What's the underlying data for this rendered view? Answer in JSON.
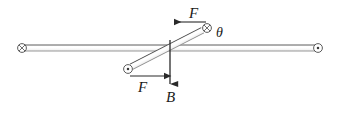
{
  "figure": {
    "type": "physics-diagram",
    "background_color": "#ffffff",
    "stroke_color": "#3a3a3a",
    "text_color": "#1a1a1a",
    "labels": {
      "force_top": "F",
      "force_bottom": "F",
      "field": "B",
      "angle": "θ"
    },
    "elements": {
      "horizontal_rod": {
        "name": "horizontal-rod",
        "x1": 22,
        "y1": 48,
        "x2": 318,
        "y2": 48,
        "thickness": 6
      },
      "diagonal_rod": {
        "name": "diagonal-rod",
        "x1": 127,
        "y1": 69,
        "x2": 207,
        "y2": 28,
        "thickness": 6,
        "angle_deg": 27
      },
      "end_markers": [
        {
          "name": "left-end-into-page",
          "symbol": "circle-x",
          "cx": 22,
          "cy": 48,
          "r": 4.5
        },
        {
          "name": "right-end-out-of-page",
          "symbol": "circle-dot",
          "cx": 318,
          "cy": 48,
          "r": 4.5
        },
        {
          "name": "upper-rod-end-into-page",
          "symbol": "circle-x",
          "cx": 207,
          "cy": 28,
          "r": 4.5
        },
        {
          "name": "lower-rod-end-out-of-page",
          "symbol": "circle-dot",
          "cx": 128,
          "cy": 69,
          "r": 4.5
        }
      ],
      "arrows": [
        {
          "name": "force-arrow-top",
          "label": "F",
          "x1": 206,
          "y1": 22,
          "x2": 172,
          "y2": 22,
          "direction": "left"
        },
        {
          "name": "force-arrow-bottom",
          "label": "F",
          "x1": 130,
          "y1": 76,
          "x2": 166,
          "y2": 76,
          "direction": "right"
        },
        {
          "name": "field-arrow",
          "label": "B",
          "x1": 170,
          "y1": 47,
          "x2": 170,
          "y2": 86,
          "direction": "down"
        }
      ]
    }
  }
}
